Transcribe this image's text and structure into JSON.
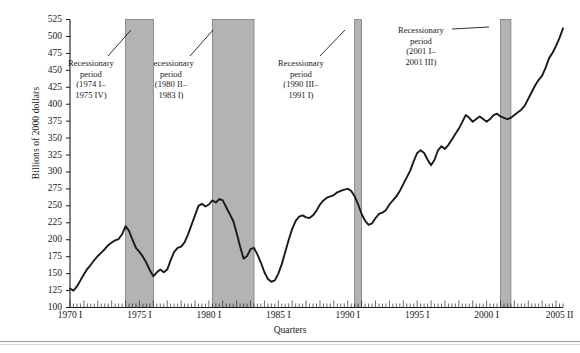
{
  "figure": {
    "ylabel": "Billions of 2000 dollars",
    "xlabel": "Quarters",
    "band_color": "#b3b3b3",
    "line_color": "#1a1a1a",
    "axis_color": "#1a1a1a"
  },
  "yticks": [
    {
      "value": 525,
      "label": "525"
    },
    {
      "value": 500,
      "label": "500"
    },
    {
      "value": 475,
      "label": "475"
    },
    {
      "value": 450,
      "label": "450"
    },
    {
      "value": 425,
      "label": "425"
    },
    {
      "value": 400,
      "label": "400"
    },
    {
      "value": 375,
      "label": "375"
    },
    {
      "value": 350,
      "label": "350"
    },
    {
      "value": 325,
      "label": "325"
    },
    {
      "value": 300,
      "label": "300"
    },
    {
      "value": 275,
      "label": "275"
    },
    {
      "value": 250,
      "label": "250"
    },
    {
      "value": 225,
      "label": "225"
    },
    {
      "value": 200,
      "label": "200"
    },
    {
      "value": 175,
      "label": "175"
    },
    {
      "value": 150,
      "label": "150"
    },
    {
      "value": 125,
      "label": "125"
    },
    {
      "value": 100,
      "label": "100"
    }
  ],
  "xticks": [
    {
      "q": 0,
      "label": "1970 I"
    },
    {
      "q": 20,
      "label": "1975 I"
    },
    {
      "q": 40,
      "label": "1980 I"
    },
    {
      "q": 60,
      "label": "1985 I"
    },
    {
      "q": 80,
      "label": "1990 I"
    },
    {
      "q": 100,
      "label": "1995 I"
    },
    {
      "q": 120,
      "label": "2000 I"
    },
    {
      "q": 141,
      "label": "2005 II"
    }
  ],
  "annotations": [
    {
      "id": "recession-1974",
      "lines": [
        "Recessionary",
        "period",
        "(1974 I–",
        "1975 IV)"
      ],
      "x": 68,
      "y": 58,
      "leader": {
        "x1": 108,
        "y1": 56,
        "x2": 131,
        "y2": 30
      }
    },
    {
      "id": "recession-1980",
      "lines": [
        "Recessionary",
        "period",
        "(1980 II–",
        "1983 I)"
      ],
      "x": 148,
      "y": 58,
      "leader": {
        "x1": 190,
        "y1": 56,
        "x2": 213,
        "y2": 30
      }
    },
    {
      "id": "recession-1990",
      "lines": [
        "Recessionary",
        "period",
        "(1990 III–",
        "1991 I)"
      ],
      "x": 278,
      "y": 58,
      "leader": {
        "x1": 320,
        "y1": 56,
        "x2": 345,
        "y2": 30
      }
    },
    {
      "id": "recession-2001",
      "lines": [
        "Recessionary",
        "period",
        "(2001 I–",
        "2001 III)"
      ],
      "x": 398,
      "y": 25,
      "leader": {
        "x1": 452,
        "y1": 29,
        "x2": 489,
        "y2": 27
      }
    }
  ],
  "chart_data": {
    "type": "line",
    "title": "",
    "xlabel": "Quarters",
    "ylabel": "Billions of 2000 dollars",
    "ylim": [
      100,
      525
    ],
    "ytick_step": 25,
    "grid": false,
    "legend": false,
    "x_start": "1970 I",
    "x_end": "2005 II",
    "x_unit": "quarter",
    "minor_ticks": "quarterly",
    "recession_bands": [
      {
        "label": "Recessionary period (1974 I–1975 IV)",
        "start": "1974 I",
        "end": "1975 IV",
        "start_q": 16,
        "end_q": 24
      },
      {
        "label": "Recessionary period (1980 II–1983 I)",
        "start": "1980 II",
        "end": "1983 I",
        "start_q": 41,
        "end_q": 53
      },
      {
        "label": "Recessionary period (1990 III–1991 I)",
        "start": "1990 III",
        "end": "1991 I",
        "start_q": 82,
        "end_q": 84
      },
      {
        "label": "Recessionary period (2001 I–2001 III)",
        "start": "2001 I",
        "end": "2001 III",
        "start_q": 124,
        "end_q": 127
      }
    ],
    "series": [
      {
        "name": "Real value",
        "values": [
          128,
          125,
          131,
          140,
          149,
          157,
          163,
          170,
          176,
          181,
          186,
          192,
          196,
          199,
          201,
          208,
          220,
          213,
          200,
          188,
          182,
          175,
          166,
          155,
          146,
          152,
          156,
          152,
          156,
          170,
          182,
          188,
          190,
          196,
          208,
          222,
          236,
          250,
          253,
          249,
          252,
          258,
          255,
          260,
          258,
          248,
          238,
          228,
          210,
          190,
          172,
          176,
          186,
          188,
          178,
          166,
          152,
          142,
          138,
          140,
          150,
          164,
          182,
          200,
          216,
          228,
          234,
          236,
          233,
          232,
          236,
          243,
          252,
          258,
          262,
          264,
          266,
          270,
          272,
          274,
          275,
          272,
          264,
          252,
          238,
          228,
          222,
          224,
          232,
          238,
          240,
          244,
          252,
          258,
          264,
          272,
          282,
          292,
          302,
          316,
          328,
          332,
          328,
          318,
          310,
          318,
          332,
          338,
          334,
          340,
          348,
          356,
          364,
          374,
          384,
          380,
          374,
          378,
          382,
          378,
          374,
          378,
          384,
          386,
          382,
          380,
          378,
          380,
          384,
          388,
          392,
          398,
          408,
          418,
          428,
          436,
          442,
          454,
          468,
          476,
          486,
          498,
          512
        ]
      }
    ]
  }
}
